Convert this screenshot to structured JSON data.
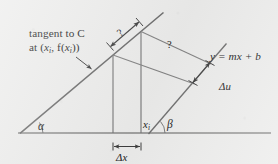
{
  "figure": {
    "background_color": "#ececeb",
    "ink_color": "#4a4a4a",
    "text_color": "#1b1b1b"
  },
  "labels": {
    "tangent_line_1": "tangent to C",
    "tangent_line_2_prefix": "at (",
    "tangent_line_2_x": "x",
    "tangent_line_2_sub1": "i",
    "tangent_line_2_mid": ", f(",
    "tangent_line_2_x2": "x",
    "tangent_line_2_sub2": "i",
    "tangent_line_2_suffix": "))",
    "question_mark_tangent": "?",
    "question_mark_parallel": "?",
    "line_equation": "y = mx + b",
    "delta_u": "Δu",
    "delta_x": "Δx",
    "x_i_base": "x",
    "x_i_sub": "i",
    "angle_alpha": "α",
    "angle_beta": "β"
  },
  "geometry": {
    "baseline": {
      "x1": 18,
      "y1": 133,
      "x2": 271,
      "y2": 133
    },
    "tangent_line": {
      "x1": 20,
      "y1": 133,
      "x2": 163,
      "y2": 13
    },
    "mxb_line": {
      "x1": 149,
      "y1": 134,
      "x2": 226,
      "y2": 44
    },
    "vertical_left": {
      "x": 113,
      "y_top": 55,
      "y_bottom": 133
    },
    "vertical_right": {
      "x": 141,
      "y_top": 32,
      "y_bottom": 133
    },
    "parallelogram": {
      "p_top_left": {
        "x": 113,
        "y": 55
      },
      "p_top_right": {
        "x": 141,
        "y": 32
      },
      "p_right_upper": {
        "x": 211,
        "y": 64
      },
      "p_right_lower": {
        "x": 194,
        "y": 84
      }
    },
    "delta_u_segment": {
      "x1": 211,
      "y1": 64,
      "x2": 194,
      "y2": 84
    },
    "delta_x_segment": {
      "x1": 113,
      "y1": 147,
      "x2": 141,
      "y2": 147
    },
    "tangent_q_arrow": {
      "x1": 109,
      "y1": 45,
      "x2": 140,
      "y2": 19
    },
    "leader_arrow": {
      "x1": 78,
      "y1": 60,
      "x2": 92,
      "y2": 70
    }
  }
}
